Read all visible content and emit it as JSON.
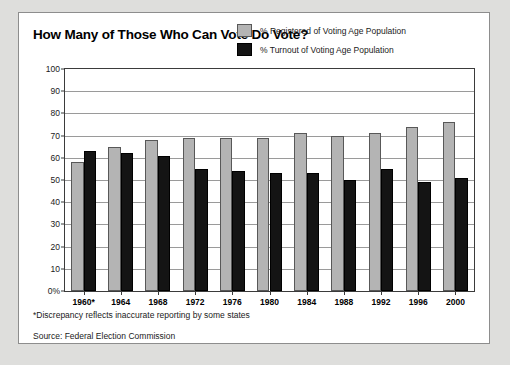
{
  "figure": {
    "title": "How Many of Those Who Can Vote Do Vote?",
    "footnote": "*Discrepancy reflects inaccurate reporting by some states",
    "source": "Source: Federal Election Commission"
  },
  "colors": {
    "registered": "#b4b4b4",
    "turnout": "#141414",
    "frame": "#3b3b3b",
    "grid": "#9a9a9a",
    "page_background": "#dededc",
    "panel_background": "#ffffff"
  },
  "chart_data": {
    "type": "bar",
    "title": "How Many of Those Who Can Vote Do Vote?",
    "xlabel": "",
    "ylabel": "",
    "ylim": [
      0,
      100
    ],
    "ytick_labels": [
      "100",
      "90",
      "80",
      "70",
      "60",
      "50",
      "40",
      "30",
      "20",
      "10",
      "0%"
    ],
    "ytick_values": [
      100,
      90,
      80,
      70,
      60,
      50,
      40,
      30,
      20,
      10,
      0
    ],
    "grid": true,
    "legend_position": "top-right",
    "categories": [
      "1960*",
      "1964",
      "1968",
      "1972",
      "1976",
      "1980",
      "1984",
      "1988",
      "1992",
      "1996",
      "2000"
    ],
    "series": [
      {
        "name": "% Registered of Voting Age Population",
        "color": "#b4b4b4",
        "values": [
          58,
          65,
          68,
          69,
          69,
          69,
          71,
          70,
          71,
          74,
          76
        ]
      },
      {
        "name": "% Turnout of Voting Age Population",
        "color": "#141414",
        "values": [
          63,
          62,
          61,
          55,
          54,
          53,
          53,
          50,
          55,
          49,
          51
        ]
      }
    ],
    "annotations": [
      "*Discrepancy reflects inaccurate reporting by some states",
      "Source: Federal Election Commission"
    ]
  }
}
